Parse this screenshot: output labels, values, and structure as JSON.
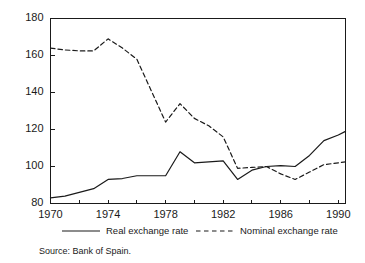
{
  "chart_data": {
    "type": "line",
    "title": "",
    "subtitle": "",
    "xlabel": "",
    "ylabel": "",
    "xlim": [
      1970,
      1990.5
    ],
    "ylim": [
      80,
      180
    ],
    "grid": false,
    "legend_position": "bottom",
    "y_ticks": [
      80,
      100,
      120,
      140,
      160,
      180
    ],
    "y_tick_labels": [
      "80",
      "100",
      "120",
      "140",
      "160",
      "180"
    ],
    "x_ticks": [
      1970,
      1972,
      1974,
      1976,
      1978,
      1980,
      1982,
      1984,
      1986,
      1988,
      1990
    ],
    "x_tick_labels": [
      "1970",
      "",
      "1974",
      "",
      "1978",
      "",
      "1982",
      "",
      "1986",
      "",
      "1990"
    ],
    "x_labeled_ticks": [
      1970,
      1974,
      1978,
      1982,
      1986,
      1990
    ],
    "x": [
      1970,
      1971,
      1972,
      1973,
      1974,
      1975,
      1976,
      1977,
      1978,
      1979,
      1980,
      1981,
      1982,
      1983,
      1984,
      1985,
      1986,
      1987,
      1988,
      1989,
      1990,
      1990.5
    ],
    "series": [
      {
        "name": "Real exchange rate",
        "style": "solid",
        "values": [
          83,
          84,
          86,
          88,
          93,
          93.5,
          95,
          95,
          95,
          108,
          102,
          102.5,
          103,
          93,
          98,
          100,
          100.5,
          100,
          106,
          114,
          117,
          119
        ]
      },
      {
        "name": "Nominal exchange rate",
        "style": "dashed",
        "values": [
          164,
          163,
          162.5,
          162.5,
          169,
          164,
          158,
          141,
          124,
          134,
          126,
          122,
          116,
          99,
          99.5,
          100,
          96,
          93,
          97,
          101,
          102,
          102.5
        ]
      }
    ],
    "annotations": []
  },
  "legend": {
    "items": [
      {
        "label": "Real exchange rate",
        "style": "solid"
      },
      {
        "label": "Nominal exchange rate",
        "style": "dashed"
      }
    ]
  },
  "footer": {
    "source": "Source: Bank of Spain."
  }
}
